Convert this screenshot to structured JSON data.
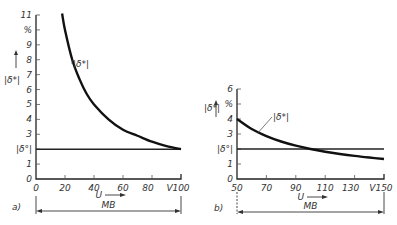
{
  "chart_data": [
    {
      "id": "a",
      "type": "line",
      "panel_label": "a)",
      "xlabel": "U",
      "x_unit": "V",
      "ylabel": "|δ*|",
      "y_unit": "%",
      "xlim": [
        0,
        100
      ],
      "ylim": [
        0,
        11
      ],
      "x_ticks": [
        0,
        20,
        40,
        60,
        80,
        100
      ],
      "x_tick_labels": [
        "0",
        "20",
        "40",
        "60",
        "80",
        "100"
      ],
      "y_ticks": [
        0,
        1,
        2,
        3,
        4,
        5,
        6,
        7,
        8,
        9,
        10,
        11
      ],
      "y_tick_labels": [
        "0",
        "1",
        "|δ°|",
        "3",
        "4",
        "5",
        "6",
        "7",
        "8",
        "9",
        "%",
        "11"
      ],
      "series": [
        {
          "name": "|δ*|",
          "x": [
            18,
            20,
            25,
            30,
            35,
            40,
            50,
            60,
            70,
            80,
            90,
            100
          ],
          "values": [
            11.1,
            10.0,
            8.0,
            6.7,
            5.7,
            5.0,
            4.0,
            3.3,
            2.9,
            2.5,
            2.2,
            2.0
          ]
        },
        {
          "name": "|δ°|",
          "x": [
            0,
            100
          ],
          "values": [
            2,
            2
          ]
        }
      ],
      "curve_label": "|δ*|",
      "range_label": "MB",
      "range": [
        0,
        100
      ],
      "grid": false
    },
    {
      "id": "b",
      "type": "line",
      "panel_label": "b)",
      "xlabel": "U",
      "x_unit": "V",
      "ylabel": "|δ*|",
      "y_unit": "%",
      "xlim": [
        50,
        150
      ],
      "ylim": [
        0,
        6
      ],
      "x_ticks": [
        50,
        70,
        90,
        110,
        130,
        150
      ],
      "x_tick_labels": [
        "50",
        "70",
        "90",
        "110",
        "130",
        "150"
      ],
      "y_ticks": [
        0,
        1,
        2,
        3,
        4,
        5,
        6
      ],
      "y_tick_labels": [
        "0",
        "1",
        "|δ°|",
        "3",
        "4",
        "%",
        "6"
      ],
      "series": [
        {
          "name": "|δ*|",
          "x": [
            50,
            60,
            70,
            80,
            90,
            100,
            110,
            120,
            130,
            140,
            150
          ],
          "values": [
            4.0,
            3.33,
            2.86,
            2.5,
            2.22,
            2.0,
            1.82,
            1.67,
            1.54,
            1.43,
            1.33
          ]
        },
        {
          "name": "|δ°|",
          "x": [
            50,
            150
          ],
          "values": [
            2,
            2
          ]
        }
      ],
      "curve_label": "|δ*|",
      "range_label": "MB",
      "range": [
        50,
        150
      ],
      "grid": false
    }
  ],
  "layout": [
    {
      "x0": 36,
      "x1": 181,
      "y0": 179,
      "y1": 15,
      "mb_y": 211,
      "mb_top": 196,
      "mb_bottom": 214,
      "label_at": [
        70,
        67
      ],
      "label_point": [
        25,
        8.0
      ],
      "xlabel_at": [
        106,
        198
      ],
      "arrow_at": [
        105,
        198
      ],
      "panel_at": [
        12,
        210
      ],
      "ylabel_at": [
        4,
        83
      ],
      "yarrow_x": 16,
      "yarrow_top": 50,
      "yarrow_bottom": 68
    },
    {
      "x0": 237,
      "x1": 384,
      "y0": 179,
      "y1": 89,
      "mb_y": 212,
      "mb_top": 192,
      "mb_bottom": 214,
      "label_at": [
        270,
        120
      ],
      "label_point": [
        64,
        3.05
      ],
      "xlabel_at": [
        308,
        200
      ],
      "arrow_at": [
        307,
        200
      ],
      "panel_at": [
        214,
        211
      ],
      "ylabel_at": [
        204,
        111
      ],
      "yarrow_x": 216,
      "yarrow_top": 100,
      "yarrow_bottom": 117
    }
  ]
}
